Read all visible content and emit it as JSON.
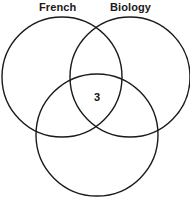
{
  "diagram": {
    "title_labels": {
      "left": "French",
      "right": "Biology"
    },
    "stroke_color": "#1a1a1a",
    "background_color": "#ffffff",
    "text_color": "#1a1a1a",
    "circles": [
      {
        "name": "french",
        "cx": 62,
        "cy": 77,
        "r": 60
      },
      {
        "name": "biology",
        "cx": 130,
        "cy": 77,
        "r": 60
      },
      {
        "name": "bottom",
        "cx": 97,
        "cy": 135,
        "r": 61
      }
    ],
    "region_values": {
      "center_all_three": "3"
    }
  }
}
